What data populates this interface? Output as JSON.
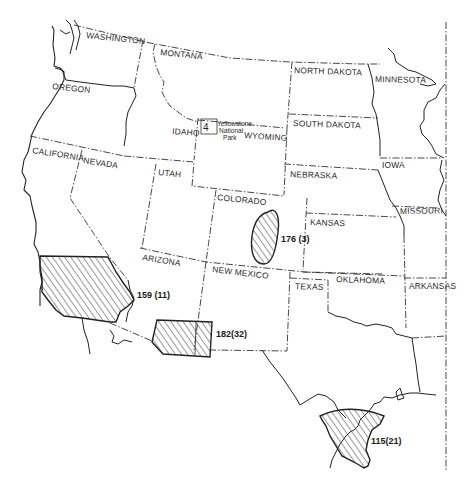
{
  "map": {
    "title": "Western United States",
    "colors": {
      "background": "#ffffff",
      "line": "#222222",
      "hatch": "#333333"
    },
    "states": [
      {
        "name": "WASHINGTON",
        "x": 86,
        "y": 38,
        "rotate": 6
      },
      {
        "name": "MONTANA",
        "x": 160,
        "y": 55,
        "rotate": 6
      },
      {
        "name": "OREGON",
        "x": 52,
        "y": 89,
        "rotate": 6
      },
      {
        "name": "IDAHO",
        "x": 172,
        "y": 134,
        "rotate": 4
      },
      {
        "name": "WYOMING",
        "x": 244,
        "y": 138,
        "rotate": 4
      },
      {
        "name": "NORTH DAKOTA",
        "x": 294,
        "y": 73,
        "rotate": 2
      },
      {
        "name": "MINNESOTA",
        "x": 375,
        "y": 82,
        "rotate": 1
      },
      {
        "name": "SOUTH DAKOTA",
        "x": 293,
        "y": 126,
        "rotate": 2
      },
      {
        "name": "IOWA",
        "x": 382,
        "y": 168,
        "rotate": 0
      },
      {
        "name": "NEBRASKA",
        "x": 290,
        "y": 177,
        "rotate": 2
      },
      {
        "name": "CALIFORNIA",
        "x": 32,
        "y": 153,
        "rotate": 9
      },
      {
        "name": "NEVADA",
        "x": 83,
        "y": 163,
        "rotate": 9
      },
      {
        "name": "UTAH",
        "x": 158,
        "y": 175,
        "rotate": 6
      },
      {
        "name": "COLORADO",
        "x": 217,
        "y": 200,
        "rotate": 6
      },
      {
        "name": "KANSAS",
        "x": 310,
        "y": 225,
        "rotate": 2
      },
      {
        "name": "MISSOURI",
        "x": 400,
        "y": 214,
        "rotate": -1
      },
      {
        "name": "ARIZONA",
        "x": 142,
        "y": 260,
        "rotate": 9
      },
      {
        "name": "NEW MEXICO",
        "x": 212,
        "y": 272,
        "rotate": 7
      },
      {
        "name": "TEXAS",
        "x": 295,
        "y": 289,
        "rotate": 2
      },
      {
        "name": "OKLAHOMA",
        "x": 336,
        "y": 282,
        "rotate": 2
      },
      {
        "name": "ARKANSAS",
        "x": 409,
        "y": 289,
        "rotate": 0
      }
    ],
    "park": {
      "lines": [
        "Yellowstone",
        "National",
        "Park"
      ]
    },
    "regions": [
      {
        "id": "southern-california",
        "label": "159 (11)",
        "label_x": 137,
        "label_y": 298
      },
      {
        "id": "colorado-plains",
        "label": "176 (3)",
        "label_x": 281,
        "label_y": 242
      },
      {
        "id": "southern-arizona-new-mexico",
        "label": "182(32)",
        "label_x": 216,
        "label_y": 337
      },
      {
        "id": "south-texas",
        "label": "115(21)",
        "label_x": 371,
        "label_y": 444
      }
    ]
  }
}
